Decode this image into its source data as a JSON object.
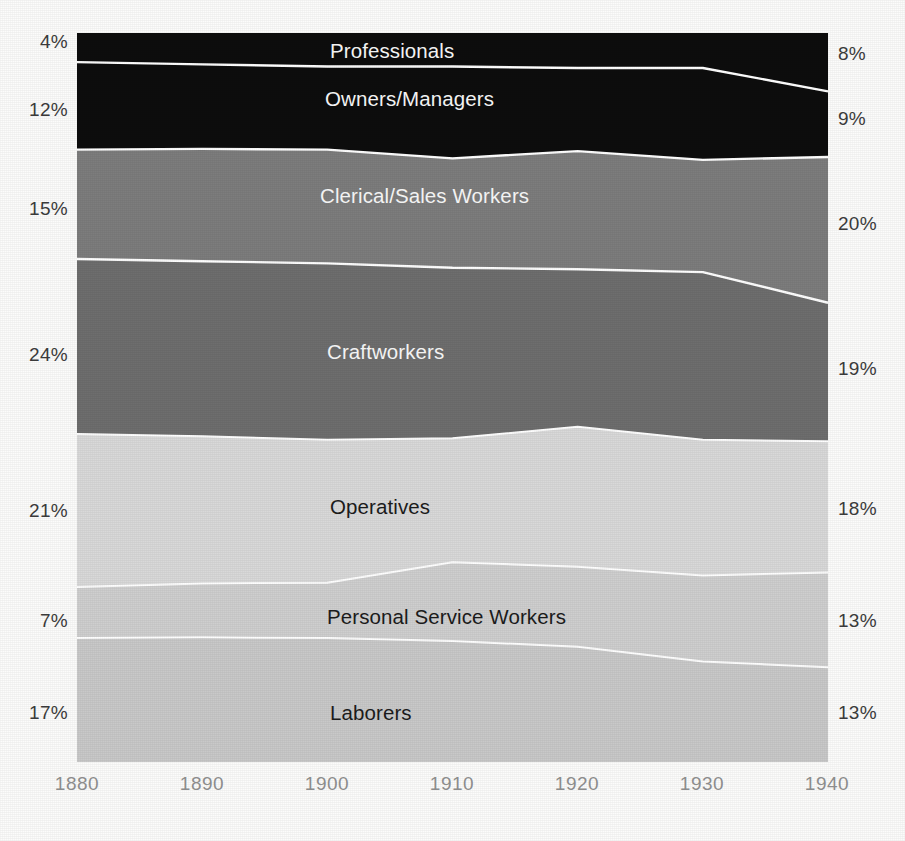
{
  "chart_data": {
    "type": "area",
    "title": "",
    "subtitle": "",
    "xlabel": "",
    "ylabel": "",
    "stacked": true,
    "normalized": true,
    "grid": false,
    "legend_position": "inline-band-labels",
    "x": [
      1880,
      1890,
      1900,
      1910,
      1920,
      1930,
      1940
    ],
    "xticks": [
      "1880",
      "1890",
      "1900",
      "1910",
      "1920",
      "1930",
      "1940"
    ],
    "xlim": [
      1880,
      1940
    ],
    "ylim": [
      0,
      100
    ],
    "series": [
      {
        "name": "Professionals",
        "color": "#0d0d0d",
        "label_color": "light",
        "start_value": 4,
        "end_value": 8,
        "start_label": "4%",
        "end_label": "8%",
        "values": [
          4,
          4.3,
          4.6,
          4.6,
          4.8,
          4.8,
          8
        ]
      },
      {
        "name": "Owners/Managers",
        "color": "#0d0d0d",
        "label_color": "light",
        "start_value": 12,
        "end_value": 9,
        "start_label": "12%",
        "end_label": "9%",
        "values": [
          12,
          11.6,
          11.4,
          12.6,
          11.4,
          12.6,
          9
        ]
      },
      {
        "name": "Clerical/Sales Workers",
        "color": "#7d7d7d",
        "label_color": "light",
        "start_value": 15,
        "end_value": 20,
        "start_label": "15%",
        "end_label": "20%",
        "values": [
          15,
          15.4,
          15.6,
          15.0,
          16.2,
          15.4,
          20
        ]
      },
      {
        "name": "Craftworkers",
        "color": "#6e6e6e",
        "label_color": "light",
        "start_value": 24,
        "end_value": 19,
        "start_label": "24%",
        "end_label": "19%",
        "values": [
          24,
          24.0,
          24.2,
          23.4,
          21.6,
          23.0,
          19
        ]
      },
      {
        "name": "Operatives",
        "color": "#d9d9d9",
        "label_color": "dark",
        "start_value": 21,
        "end_value": 18,
        "start_label": "21%",
        "end_label": "18%",
        "values": [
          21,
          20.2,
          19.6,
          17.0,
          19.2,
          18.6,
          18
        ]
      },
      {
        "name": "Personal Service Workers",
        "color": "#cfcfcf",
        "label_color": "dark",
        "start_value": 7,
        "end_value": 13,
        "start_label": "7%",
        "end_label": "13%",
        "values": [
          7,
          7.4,
          7.6,
          10.8,
          11.0,
          11.8,
          13
        ]
      },
      {
        "name": "Laborers",
        "color": "#c9c9c9",
        "label_color": "dark",
        "start_value": 17,
        "end_value": 13,
        "start_label": "17%",
        "end_label": "13%",
        "values": [
          17,
          17.1,
          17.0,
          16.6,
          15.8,
          13.8,
          13
        ]
      }
    ],
    "left_axis_labels": [
      "4%",
      "12%",
      "15%",
      "24%",
      "21%",
      "7%",
      "17%"
    ],
    "right_axis_labels": [
      "8%",
      "9%",
      "20%",
      "19%",
      "18%",
      "13%",
      "13%"
    ]
  }
}
